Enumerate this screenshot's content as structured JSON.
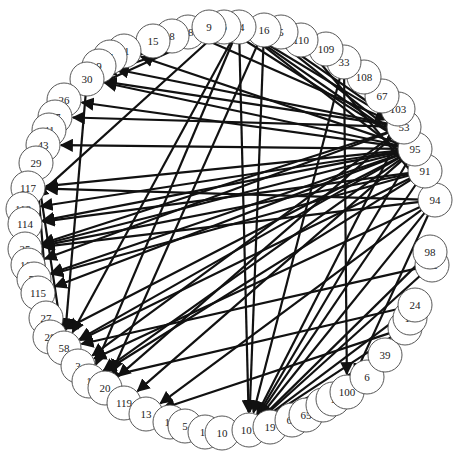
{
  "diagram": {
    "type": "circular-network-graph",
    "node_radius": 17,
    "colors": {
      "edge": "#111111",
      "node_fill": "#ffffff",
      "node_stroke": "#444444",
      "label": "#222222",
      "background": "#ffffff"
    },
    "nodes": [
      {
        "id": "18",
        "x": 188,
        "y": 32
      },
      {
        "id": "8",
        "x": 172,
        "y": 36
      },
      {
        "id": "15",
        "x": 153,
        "y": 41
      },
      {
        "id": "21",
        "x": 124,
        "y": 51
      },
      {
        "id": "7",
        "x": 110,
        "y": 57
      },
      {
        "id": "9",
        "x": 99,
        "y": 66
      },
      {
        "id": "30",
        "x": 87,
        "y": 79
      },
      {
        "id": "26",
        "x": 64,
        "y": 100
      },
      {
        "id": "17",
        "x": 55,
        "y": 117
      },
      {
        "id": "41",
        "x": 49,
        "y": 130
      },
      {
        "id": "43",
        "x": 43,
        "y": 145
      },
      {
        "id": "29",
        "x": 36,
        "y": 163
      },
      {
        "id": "117",
        "x": 28,
        "y": 188
      },
      {
        "id": "118",
        "x": 23,
        "y": 209
      },
      {
        "id": "114",
        "x": 25,
        "y": 224
      },
      {
        "id": "25",
        "x": 25,
        "y": 249
      },
      {
        "id": "110b",
        "label": "110",
        "x": 28,
        "y": 265
      },
      {
        "id": "55",
        "x": 34,
        "y": 279
      },
      {
        "id": "115",
        "x": 38,
        "y": 293
      },
      {
        "id": "27",
        "x": 46,
        "y": 318
      },
      {
        "id": "28",
        "x": 50,
        "y": 337
      },
      {
        "id": "58",
        "x": 64,
        "y": 348
      },
      {
        "id": "3",
        "x": 78,
        "y": 366
      },
      {
        "id": "1",
        "x": 89,
        "y": 381
      },
      {
        "id": "20",
        "x": 105,
        "y": 388
      },
      {
        "id": "119",
        "x": 124,
        "y": 403
      },
      {
        "id": "13",
        "x": 146,
        "y": 414
      },
      {
        "id": "12",
        "x": 170,
        "y": 422
      },
      {
        "id": "5",
        "x": 185,
        "y": 426
      },
      {
        "id": "11",
        "x": 205,
        "y": 432
      },
      {
        "id": "10",
        "x": 222,
        "y": 433
      },
      {
        "id": "101",
        "x": 249,
        "y": 430
      },
      {
        "id": "19",
        "x": 270,
        "y": 427
      },
      {
        "id": "61",
        "x": 292,
        "y": 420
      },
      {
        "id": "65",
        "x": 306,
        "y": 415
      },
      {
        "id": "0",
        "x": 323,
        "y": 405
      },
      {
        "id": "11b",
        "label": "1",
        "x": 333,
        "y": 399
      },
      {
        "id": "100",
        "x": 347,
        "y": 392
      },
      {
        "id": "6",
        "x": 367,
        "y": 377
      },
      {
        "id": "39",
        "x": 385,
        "y": 355
      },
      {
        "id": "57",
        "x": 405,
        "y": 328
      },
      {
        "id": "10c",
        "label": "10",
        "x": 410,
        "y": 318
      },
      {
        "id": "24",
        "x": 415,
        "y": 305
      },
      {
        "id": "92",
        "x": 432,
        "y": 265
      },
      {
        "id": "98",
        "x": 430,
        "y": 252
      },
      {
        "id": "94",
        "x": 435,
        "y": 200
      },
      {
        "id": "91",
        "x": 425,
        "y": 171
      },
      {
        "id": "95",
        "x": 415,
        "y": 149
      },
      {
        "id": "53",
        "x": 404,
        "y": 127
      },
      {
        "id": "103",
        "x": 398,
        "y": 109
      },
      {
        "id": "67",
        "x": 382,
        "y": 96
      },
      {
        "id": "108",
        "x": 364,
        "y": 77
      },
      {
        "id": "33",
        "x": 344,
        "y": 62
      },
      {
        "id": "109",
        "x": 326,
        "y": 49
      },
      {
        "id": "110",
        "x": 301,
        "y": 40
      },
      {
        "id": "5b",
        "label": "5",
        "x": 281,
        "y": 32
      },
      {
        "id": "16",
        "x": 264,
        "y": 30
      },
      {
        "id": "14",
        "x": 239,
        "y": 27
      },
      {
        "id": "6b",
        "label": "6",
        "x": 224,
        "y": 27
      },
      {
        "id": "9b",
        "label": "9",
        "x": 209,
        "y": 27
      }
    ],
    "edges": [
      [
        "95",
        "30"
      ],
      [
        "95",
        "21"
      ],
      [
        "95",
        "26"
      ],
      [
        "95",
        "43"
      ],
      [
        "95",
        "117"
      ],
      [
        "95",
        "114"
      ],
      [
        "95",
        "25"
      ],
      [
        "95",
        "55"
      ],
      [
        "95",
        "115"
      ],
      [
        "95",
        "118"
      ],
      [
        "95",
        "28"
      ],
      [
        "95",
        "1"
      ],
      [
        "95",
        "119"
      ],
      [
        "95",
        "101"
      ],
      [
        "95",
        "58"
      ],
      [
        "53",
        "30"
      ],
      [
        "53",
        "17"
      ],
      [
        "53",
        "25"
      ],
      [
        "53",
        "110b"
      ],
      [
        "53",
        "9"
      ],
      [
        "53",
        "101"
      ],
      [
        "53",
        "20"
      ],
      [
        "53",
        "3"
      ],
      [
        "91",
        "25"
      ],
      [
        "91",
        "55"
      ],
      [
        "91",
        "114"
      ],
      [
        "91",
        "101"
      ],
      [
        "91",
        "58"
      ],
      [
        "91",
        "1"
      ],
      [
        "94",
        "25"
      ],
      [
        "94",
        "117"
      ],
      [
        "94",
        "101"
      ],
      [
        "94",
        "100"
      ],
      [
        "94",
        "3"
      ],
      [
        "94",
        "13"
      ],
      [
        "14",
        "1"
      ],
      [
        "14",
        "58"
      ],
      [
        "14",
        "9"
      ],
      [
        "14",
        "53"
      ],
      [
        "14",
        "95"
      ],
      [
        "14",
        "91"
      ],
      [
        "14",
        "30"
      ],
      [
        "14",
        "101"
      ],
      [
        "16",
        "53"
      ],
      [
        "16",
        "95"
      ],
      [
        "16",
        "101"
      ],
      [
        "16",
        "20"
      ],
      [
        "6b",
        "95"
      ],
      [
        "6b",
        "26"
      ],
      [
        "6b",
        "118"
      ],
      [
        "18",
        "53"
      ],
      [
        "18",
        "21"
      ],
      [
        "30",
        "58"
      ],
      [
        "29",
        "58"
      ],
      [
        "29",
        "28"
      ],
      [
        "33",
        "101"
      ],
      [
        "33",
        "100"
      ],
      [
        "109",
        "95"
      ],
      [
        "110",
        "94"
      ],
      [
        "67",
        "95"
      ],
      [
        "108",
        "53"
      ],
      [
        "103",
        "95"
      ],
      [
        "92",
        "101"
      ],
      [
        "57",
        "101"
      ],
      [
        "24",
        "101"
      ],
      [
        "39",
        "101"
      ],
      [
        "98",
        "101"
      ],
      [
        "6",
        "100"
      ],
      [
        "92",
        "58"
      ],
      [
        "24",
        "1"
      ],
      [
        "57",
        "13"
      ]
    ],
    "labels_visible": [
      "18",
      "8",
      "15",
      "21",
      "7",
      "9",
      "30",
      "26",
      "17",
      "41",
      "43",
      "29",
      "117",
      "118",
      "114",
      "25",
      "110",
      "55",
      "115",
      "27",
      "28",
      "58",
      "3",
      "1",
      "20",
      "119",
      "13",
      "12",
      "5",
      "11",
      "1",
      "101",
      "1",
      "61",
      "5",
      "0",
      "1",
      "100",
      "6",
      "57",
      "10",
      "24",
      "92",
      "98",
      "94",
      "91",
      "95",
      "53",
      "103",
      "67",
      "108",
      "33",
      "109",
      "110",
      "5",
      "16",
      "14",
      "6",
      "9"
    ]
  }
}
